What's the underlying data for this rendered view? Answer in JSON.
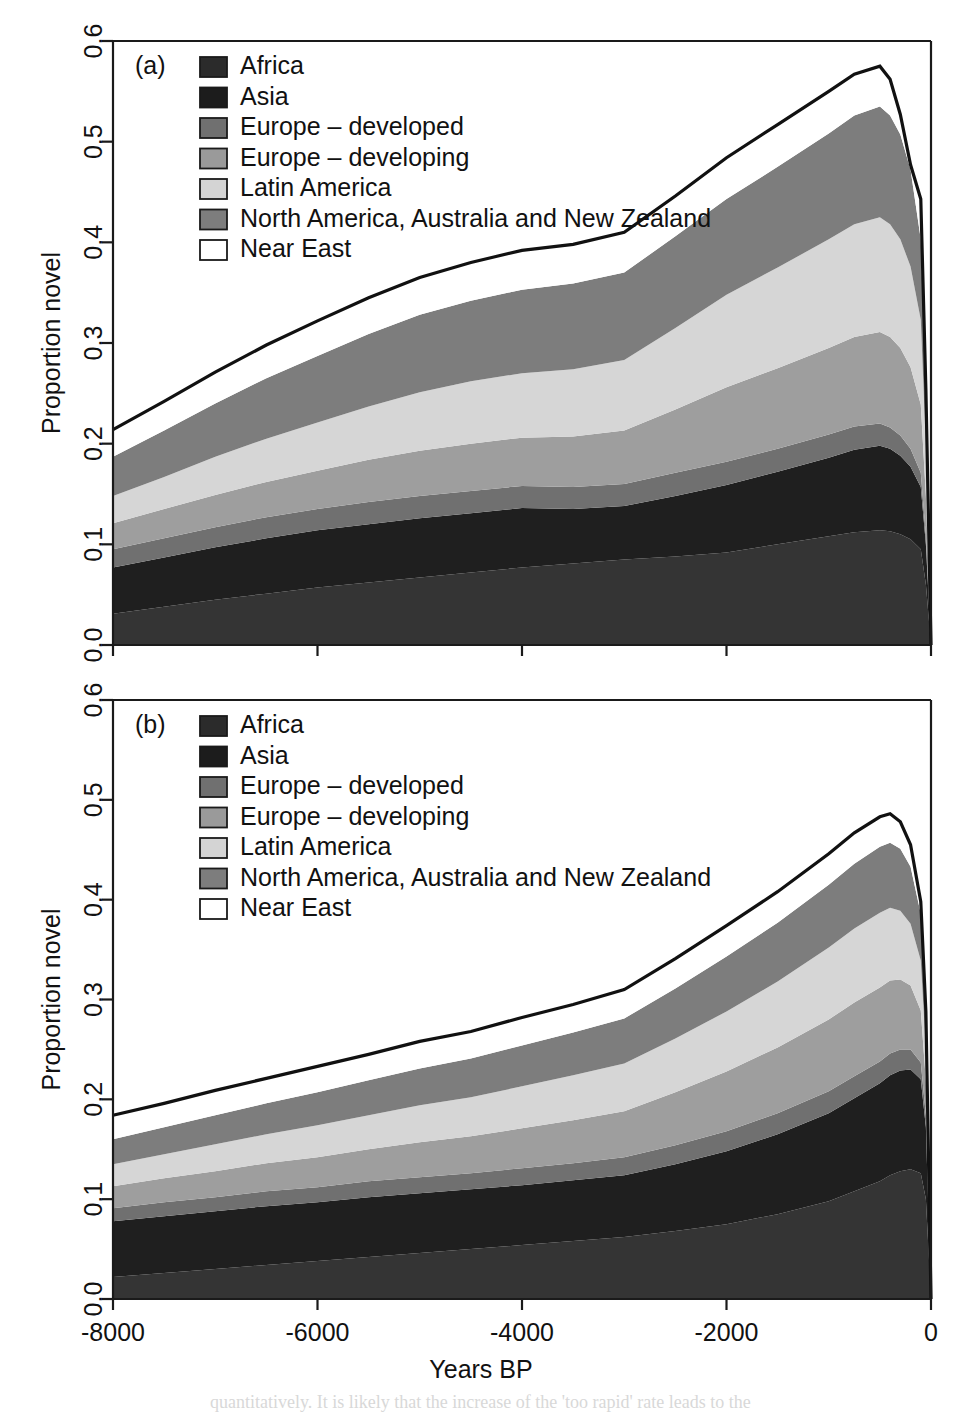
{
  "figure": {
    "width": 962,
    "height": 1419,
    "background": "#ffffff",
    "axis_color": "#1a1a1a"
  },
  "axes": {
    "x_title": "Years BP",
    "y_title": "Proportion novel",
    "x_ticks": [
      "-8000",
      "-6000",
      "-4000",
      "-2000",
      "0"
    ],
    "x_tick_values": [
      -8000,
      -6000,
      -4000,
      -2000,
      0
    ],
    "y_ticks": [
      "0.0",
      "0.1",
      "0.2",
      "0.3",
      "0.4",
      "0.5",
      "0.6"
    ],
    "y_tick_values": [
      0.0,
      0.1,
      0.2,
      0.3,
      0.4,
      0.5,
      0.6
    ]
  },
  "legend": {
    "entries": [
      {
        "label": "Africa",
        "color": "#2b2b2b"
      },
      {
        "label": "Asia",
        "color": "#1c1c1c"
      },
      {
        "label": "Europe – developed",
        "color": "#707070"
      },
      {
        "label": "Europe – developing",
        "color": "#9a9a9a"
      },
      {
        "label": "Latin America",
        "color": "#d4d4d4"
      },
      {
        "label": "North America, Australia and New Zealand",
        "color": "#7d7d7d"
      },
      {
        "label": "Near East",
        "color": "#ffffff"
      }
    ]
  },
  "panels": [
    {
      "id": "a",
      "label": "(a)"
    },
    {
      "id": "b",
      "label": "(b)"
    }
  ],
  "chart_data": [
    {
      "type": "area",
      "id": "panel-a",
      "title": "(a)",
      "xlabel": "Years BP",
      "ylabel": "Proportion novel",
      "xlim": [
        -8000,
        0
      ],
      "ylim": [
        0.0,
        0.6
      ],
      "grid": false,
      "legend_position": "top-left",
      "stacked": true,
      "x": [
        -8000,
        -7500,
        -7000,
        -6500,
        -6000,
        -5500,
        -5000,
        -4500,
        -4000,
        -3500,
        -3000,
        -2500,
        -2000,
        -1500,
        -1000,
        -750,
        -500,
        -400,
        -300,
        -200,
        -100,
        -50,
        0
      ],
      "series": [
        {
          "name": "Africa",
          "color": "#343434",
          "values": [
            0.031,
            0.038,
            0.045,
            0.051,
            0.057,
            0.062,
            0.067,
            0.072,
            0.077,
            0.081,
            0.085,
            0.088,
            0.092,
            0.1,
            0.108,
            0.112,
            0.114,
            0.113,
            0.11,
            0.105,
            0.095,
            0.06,
            0.0
          ]
        },
        {
          "name": "Asia",
          "color": "#1f1f1f",
          "values": [
            0.046,
            0.049,
            0.052,
            0.055,
            0.057,
            0.058,
            0.059,
            0.059,
            0.059,
            0.054,
            0.053,
            0.06,
            0.067,
            0.072,
            0.078,
            0.082,
            0.084,
            0.082,
            0.078,
            0.072,
            0.062,
            0.04,
            0.0
          ]
        },
        {
          "name": "Europe – developed",
          "color": "#707070",
          "values": [
            0.018,
            0.019,
            0.02,
            0.021,
            0.021,
            0.022,
            0.022,
            0.022,
            0.022,
            0.022,
            0.022,
            0.023,
            0.023,
            0.023,
            0.023,
            0.023,
            0.022,
            0.021,
            0.02,
            0.018,
            0.014,
            0.008,
            0.0
          ]
        },
        {
          "name": "Europe – developing",
          "color": "#9e9e9e",
          "values": [
            0.026,
            0.029,
            0.032,
            0.035,
            0.038,
            0.042,
            0.045,
            0.047,
            0.048,
            0.05,
            0.053,
            0.063,
            0.074,
            0.08,
            0.086,
            0.089,
            0.091,
            0.09,
            0.087,
            0.081,
            0.068,
            0.04,
            0.0
          ]
        },
        {
          "name": "Latin America",
          "color": "#d6d6d6",
          "values": [
            0.027,
            0.032,
            0.038,
            0.043,
            0.048,
            0.053,
            0.058,
            0.062,
            0.064,
            0.067,
            0.07,
            0.081,
            0.092,
            0.1,
            0.108,
            0.112,
            0.114,
            0.112,
            0.108,
            0.1,
            0.084,
            0.05,
            0.0
          ]
        },
        {
          "name": "North America, Australia and New Zealand",
          "color": "#7d7d7d",
          "values": [
            0.039,
            0.046,
            0.053,
            0.06,
            0.066,
            0.072,
            0.077,
            0.08,
            0.083,
            0.085,
            0.087,
            0.091,
            0.095,
            0.1,
            0.105,
            0.108,
            0.11,
            0.108,
            0.104,
            0.096,
            0.08,
            0.046,
            0.0
          ]
        },
        {
          "name": "Near East",
          "color": "#ffffff",
          "values": [
            0.027,
            0.029,
            0.031,
            0.033,
            0.035,
            0.036,
            0.037,
            0.038,
            0.039,
            0.039,
            0.04,
            0.04,
            0.041,
            0.042,
            0.042,
            0.041,
            0.04,
            0.036,
            0.02,
            0.005,
            0.04,
            0.01,
            0.0
          ]
        }
      ],
      "total": [
        0.214,
        0.242,
        0.271,
        0.298,
        0.322,
        0.345,
        0.365,
        0.38,
        0.392,
        0.398,
        0.41,
        0.446,
        0.484,
        0.517,
        0.55,
        0.567,
        0.575,
        0.562,
        0.527,
        0.477,
        0.443,
        0.254,
        0.0
      ],
      "total_line_color": "#111111"
    },
    {
      "type": "area",
      "id": "panel-b",
      "title": "(b)",
      "xlabel": "Years BP",
      "ylabel": "Proportion novel",
      "xlim": [
        -8000,
        0
      ],
      "ylim": [
        0.0,
        0.6
      ],
      "grid": false,
      "legend_position": "top-left",
      "stacked": true,
      "x": [
        -8000,
        -7500,
        -7000,
        -6500,
        -6000,
        -5500,
        -5000,
        -4500,
        -4000,
        -3500,
        -3000,
        -2500,
        -2000,
        -1500,
        -1000,
        -750,
        -500,
        -400,
        -300,
        -200,
        -100,
        -50,
        0
      ],
      "series": [
        {
          "name": "Africa",
          "color": "#343434",
          "values": [
            0.022,
            0.026,
            0.03,
            0.034,
            0.038,
            0.042,
            0.046,
            0.05,
            0.054,
            0.058,
            0.062,
            0.068,
            0.075,
            0.085,
            0.098,
            0.108,
            0.118,
            0.124,
            0.128,
            0.13,
            0.126,
            0.1,
            0.0
          ]
        },
        {
          "name": "Asia",
          "color": "#1f1f1f",
          "values": [
            0.056,
            0.057,
            0.058,
            0.059,
            0.059,
            0.06,
            0.06,
            0.06,
            0.06,
            0.061,
            0.062,
            0.067,
            0.073,
            0.08,
            0.088,
            0.093,
            0.098,
            0.1,
            0.101,
            0.1,
            0.094,
            0.072,
            0.0
          ]
        },
        {
          "name": "Europe – developed",
          "color": "#707070",
          "values": [
            0.013,
            0.014,
            0.014,
            0.015,
            0.015,
            0.016,
            0.016,
            0.016,
            0.017,
            0.017,
            0.018,
            0.019,
            0.02,
            0.021,
            0.022,
            0.022,
            0.022,
            0.022,
            0.021,
            0.02,
            0.017,
            0.012,
            0.0
          ]
        },
        {
          "name": "Europe – developing",
          "color": "#9e9e9e",
          "values": [
            0.022,
            0.024,
            0.026,
            0.028,
            0.03,
            0.032,
            0.035,
            0.037,
            0.04,
            0.043,
            0.046,
            0.053,
            0.06,
            0.066,
            0.072,
            0.074,
            0.074,
            0.073,
            0.07,
            0.064,
            0.052,
            0.034,
            0.0
          ]
        },
        {
          "name": "Latin America",
          "color": "#d6d6d6",
          "values": [
            0.022,
            0.024,
            0.027,
            0.029,
            0.032,
            0.034,
            0.037,
            0.039,
            0.042,
            0.045,
            0.048,
            0.054,
            0.06,
            0.066,
            0.072,
            0.074,
            0.075,
            0.073,
            0.069,
            0.062,
            0.05,
            0.032,
            0.0
          ]
        },
        {
          "name": "North America, Australia and New Zealand",
          "color": "#7d7d7d",
          "values": [
            0.025,
            0.027,
            0.029,
            0.031,
            0.033,
            0.035,
            0.037,
            0.039,
            0.041,
            0.043,
            0.045,
            0.05,
            0.055,
            0.059,
            0.063,
            0.065,
            0.066,
            0.065,
            0.062,
            0.057,
            0.047,
            0.03,
            0.0
          ]
        },
        {
          "name": "Near East",
          "color": "#ffffff",
          "values": [
            0.024,
            0.024,
            0.025,
            0.025,
            0.026,
            0.026,
            0.027,
            0.027,
            0.028,
            0.028,
            0.029,
            0.03,
            0.031,
            0.031,
            0.031,
            0.031,
            0.03,
            0.029,
            0.027,
            0.022,
            0.012,
            0.008,
            0.0
          ]
        }
      ],
      "total": [
        0.184,
        0.196,
        0.209,
        0.221,
        0.233,
        0.245,
        0.258,
        0.268,
        0.282,
        0.295,
        0.31,
        0.341,
        0.374,
        0.408,
        0.446,
        0.467,
        0.483,
        0.486,
        0.478,
        0.455,
        0.398,
        0.288,
        0.0
      ],
      "total_line_color": "#111111"
    }
  ],
  "bleed_text": [
    {
      "text": "quantitatively. It is likely that the increase of the 'too rapid' rate leads to the",
      "x": 210,
      "y": 1390
    }
  ]
}
